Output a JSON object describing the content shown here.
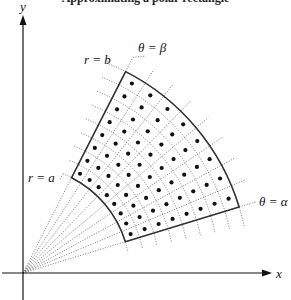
{
  "caption": "Approximating a polar rectangle",
  "axes": {
    "origin": [
      23,
      273
    ],
    "x_label": "x",
    "y_label": "y",
    "x_end": 272,
    "y_top": 15,
    "y_bottom": 300,
    "x_start": 2
  },
  "region": {
    "inner_radius_px": 107,
    "outer_radius_px": 226,
    "alpha_deg": 17,
    "beta_deg": 63,
    "radial_divisions": 8,
    "angular_divisions": 8,
    "ray_extension_px": 16,
    "arc_extension_deg": 5
  },
  "labels": {
    "r_a": "r = a",
    "r_b": "r = b",
    "theta_alpha": "θ = α",
    "theta_beta": "θ = β"
  },
  "colors": {
    "boundary": "#333333",
    "grid": "#555555",
    "dots": "#111111",
    "axes": "#111111"
  }
}
